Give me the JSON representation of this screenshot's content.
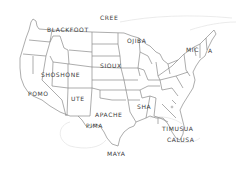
{
  "map": {
    "title": "Native American tribes of North America",
    "line_color": "#8a8a8a",
    "faint_color": "#e2e2e2",
    "label_color": "#3a3a3a",
    "labels": [
      {
        "id": "cree",
        "text": "CREE",
        "x": 100,
        "y": 17
      },
      {
        "id": "blackfoot",
        "text": "BLACKFOOT",
        "x": 47,
        "y": 29
      },
      {
        "id": "ojiba",
        "text": "OJIBA",
        "x": 127,
        "y": 39
      },
      {
        "id": "mic",
        "text": "MIC",
        "x": 186,
        "y": 48
      },
      {
        "id": "a",
        "text": "A",
        "x": 208,
        "y": 48
      },
      {
        "id": "sioux",
        "text": "SIOUX",
        "x": 100,
        "y": 63
      },
      {
        "id": "shoshone",
        "text": "SHOSHONE",
        "x": 41,
        "y": 72
      },
      {
        "id": "pomo",
        "text": "POMO",
        "x": 28,
        "y": 91
      },
      {
        "id": "ute",
        "text": "UTE",
        "x": 71,
        "y": 96
      },
      {
        "id": "sha",
        "text": "SHA",
        "x": 137,
        "y": 103
      },
      {
        "id": "apache",
        "text": "APACHE",
        "x": 95,
        "y": 111
      },
      {
        "id": "pima",
        "text": "PIMA",
        "x": 86,
        "y": 122
      },
      {
        "id": "timusua",
        "text": "TIMUSUA",
        "x": 162,
        "y": 125
      },
      {
        "id": "calusa",
        "text": "CALUSA",
        "x": 167,
        "y": 136
      },
      {
        "id": "maya",
        "text": "MAYA",
        "x": 107,
        "y": 150
      }
    ]
  }
}
